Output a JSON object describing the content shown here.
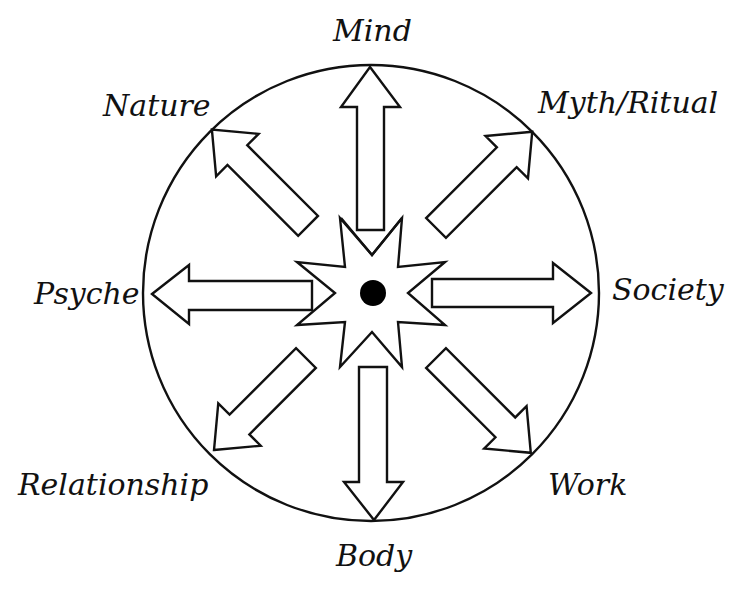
{
  "diagram": {
    "type": "radial",
    "center_marker": "filled-dot",
    "hub_shape": "eight-point-star",
    "enclosure": "circle",
    "connector": "double-headed-arrow",
    "colors": {
      "stroke": "#111111",
      "fill": "#ffffff",
      "hub": "#000000"
    },
    "labels": {
      "top": "Mind",
      "top_right": "Myth/Ritual",
      "right": "Society",
      "bottom_right": "Work",
      "bottom": "Body",
      "bottom_left": "Relationship",
      "left": "Psyche",
      "top_left": "Nature"
    }
  }
}
